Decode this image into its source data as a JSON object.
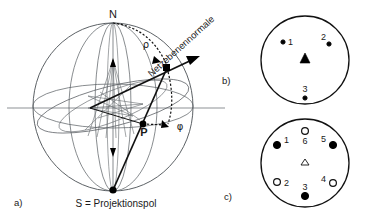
{
  "figure": {
    "background_color": "#ffffff",
    "line_color": "#555a5e",
    "accent_color": "#000000",
    "axis_color": "#8d9296"
  },
  "panel_a": {
    "label": "a)",
    "north_pole_label": "N",
    "south_pole_label": "S = Projektionspol",
    "point_p_label": "P",
    "angle_rho_label": "ρ",
    "angle_phi_label": "φ",
    "normal_label": "Netzebenennormale",
    "sphere": {
      "center_x": 113,
      "center_y": 107,
      "radius_x": 80,
      "radius_y": 84
    }
  },
  "panel_b": {
    "label": "b)",
    "circle": {
      "center_x": 305,
      "center_y": 60,
      "radius": 44
    },
    "center_marker": {
      "type": "triangle-filled",
      "name": "zone-axis-marker"
    },
    "points": [
      {
        "id": "1",
        "label": "1",
        "type": "small-filled-circle",
        "x": 283,
        "y": 42,
        "label_x": 289,
        "label_y": 42
      },
      {
        "id": "2",
        "label": "2",
        "type": "small-filled-circle",
        "x": 329,
        "y": 42,
        "label_x": 322,
        "label_y": 38
      },
      {
        "id": "3",
        "label": "3",
        "type": "small-filled-circle",
        "x": 305,
        "y": 97,
        "label_x": 305,
        "label_y": 90
      }
    ]
  },
  "panel_c": {
    "label": "c)",
    "circle": {
      "center_x": 305,
      "center_y": 163,
      "radius": 44
    },
    "center_marker": {
      "type": "triangle-open",
      "name": "zone-axis-marker"
    },
    "points": [
      {
        "id": "1",
        "label": "1",
        "type": "filled-circle",
        "x": 276,
        "y": 144,
        "label_x": 285,
        "label_y": 141
      },
      {
        "id": "2",
        "label": "2",
        "type": "open-circle",
        "x": 276,
        "y": 183,
        "label_x": 285,
        "label_y": 185
      },
      {
        "id": "3",
        "label": "3",
        "type": "filled-circle",
        "x": 305,
        "y": 196,
        "label_x": 305,
        "label_y": 189
      },
      {
        "id": "4",
        "label": "4",
        "type": "open-circle",
        "x": 333,
        "y": 183,
        "label_x": 326,
        "label_y": 182
      },
      {
        "id": "5",
        "label": "5",
        "type": "filled-circle",
        "x": 333,
        "y": 144,
        "label_x": 325,
        "label_y": 140
      },
      {
        "id": "6",
        "label": "6",
        "type": "open-circle",
        "x": 305,
        "y": 131,
        "label_x": 305,
        "label_y": 145
      }
    ]
  }
}
